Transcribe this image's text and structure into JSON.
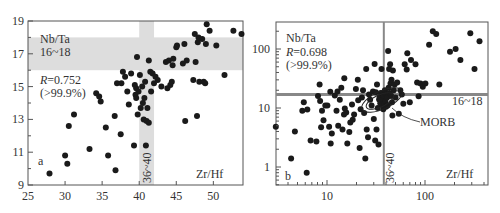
{
  "chart_data": [
    {
      "id": "a",
      "type": "scatter",
      "panel_label": "a",
      "xlabel": "Zr/Hf",
      "ylabel": "Nb/Ta",
      "xlim": [
        25,
        54
      ],
      "ylim": [
        9,
        19
      ],
      "x_scale": "linear",
      "y_scale": "linear",
      "x_ticks": [
        25,
        30,
        35,
        40,
        45,
        50
      ],
      "y_ticks": [
        9,
        11,
        13,
        15,
        17,
        19
      ],
      "grid": false,
      "annotations": {
        "y_band_label_1": "Nb/Ta",
        "y_band_label_2": "16~18",
        "r_label": "R=0.752",
        "r_value": "0.752",
        "significance": "(>99.9%)",
        "x_band_label": "36~40"
      },
      "bands": {
        "horizontal": {
          "from": 16,
          "to": 18,
          "color": "#dddddd"
        },
        "vertical": {
          "from": 40,
          "to": 42,
          "color": "#dddddd"
        }
      },
      "points": [
        [
          27.9,
          9.7
        ],
        [
          30.0,
          10.8
        ],
        [
          30.3,
          10.3
        ],
        [
          30.5,
          12.6
        ],
        [
          31.2,
          13.3
        ],
        [
          33.3,
          11.2
        ],
        [
          34.2,
          14.6
        ],
        [
          34.6,
          14.4
        ],
        [
          34.8,
          14.1
        ],
        [
          35.5,
          12.5
        ],
        [
          35.8,
          10.8
        ],
        [
          36.7,
          13.2
        ],
        [
          36.8,
          9.9
        ],
        [
          37.0,
          15.2
        ],
        [
          37.5,
          12.1
        ],
        [
          37.6,
          15.2
        ],
        [
          37.8,
          15.9
        ],
        [
          38.1,
          15.6
        ],
        [
          38.4,
          14.7
        ],
        [
          38.6,
          13.9
        ],
        [
          38.9,
          15.8
        ],
        [
          39.3,
          11.4
        ],
        [
          39.4,
          15.1
        ],
        [
          39.5,
          14.5
        ],
        [
          39.6,
          14.9
        ],
        [
          39.6,
          14.3
        ],
        [
          39.7,
          16.8
        ],
        [
          39.8,
          13.3
        ],
        [
          39.9,
          14.7
        ],
        [
          40.1,
          15.7
        ],
        [
          40.2,
          13.7
        ],
        [
          40.4,
          15.0
        ],
        [
          40.5,
          14.0
        ],
        [
          40.6,
          13.0
        ],
        [
          40.7,
          14.3
        ],
        [
          40.8,
          15.3
        ],
        [
          40.9,
          11.4
        ],
        [
          41.0,
          12.9
        ],
        [
          41.1,
          13.7
        ],
        [
          41.3,
          16.6
        ],
        [
          41.3,
          12.8
        ],
        [
          41.5,
          15.9
        ],
        [
          41.6,
          14.7
        ],
        [
          41.8,
          15.8
        ],
        [
          42.0,
          15.2
        ],
        [
          42.2,
          15.6
        ],
        [
          42.5,
          15.4
        ],
        [
          43.0,
          15.0
        ],
        [
          43.6,
          16.5
        ],
        [
          43.8,
          14.9
        ],
        [
          44.0,
          16.6
        ],
        [
          44.2,
          15.1
        ],
        [
          44.4,
          15.3
        ],
        [
          44.5,
          16.3
        ],
        [
          44.6,
          16.7
        ],
        [
          45.0,
          17.4
        ],
        [
          45.1,
          17.5
        ],
        [
          45.9,
          16.4
        ],
        [
          46.1,
          17.6
        ],
        [
          46.2,
          12.9
        ],
        [
          46.4,
          16.6
        ],
        [
          47.3,
          15.4
        ],
        [
          47.5,
          18.2
        ],
        [
          47.6,
          16.5
        ],
        [
          47.8,
          13.2
        ],
        [
          47.9,
          17.7
        ],
        [
          48.0,
          18.0
        ],
        [
          48.1,
          15.3
        ],
        [
          48.5,
          17.9
        ],
        [
          48.7,
          15.3
        ],
        [
          48.9,
          15.2
        ],
        [
          49.0,
          17.6
        ],
        [
          49.1,
          18.8
        ],
        [
          49.5,
          18.4
        ],
        [
          50.4,
          17.5
        ],
        [
          51.5,
          15.7
        ],
        [
          52.7,
          18.4
        ],
        [
          53.8,
          18.2
        ]
      ]
    },
    {
      "id": "b",
      "type": "scatter",
      "panel_label": "b",
      "xlabel": "Zr/Hf",
      "ylabel": "Nb/Ta",
      "xlim": [
        3,
        450
      ],
      "ylim": [
        0.4,
        300
      ],
      "x_scale": "log",
      "y_scale": "log",
      "x_ticks": [
        10,
        100
      ],
      "y_ticks": [
        1,
        10,
        100
      ],
      "grid": false,
      "annotations": {
        "y_label": "Nb/Ta",
        "r_label": "R=0.698",
        "r_value": "0.698",
        "significance": "(>99.9%)",
        "x_line_label": "36~40",
        "y_line_label": "16~18",
        "field_label": "MORB"
      },
      "reference_lines": {
        "horizontal": 17,
        "vertical": 38,
        "color": "#888888"
      },
      "points": [
        [
          3.0,
          4.8
        ],
        [
          4.3,
          1.4
        ],
        [
          4.7,
          4.0
        ],
        [
          5.6,
          9.0
        ],
        [
          5.8,
          12.5
        ],
        [
          6.2,
          0.8
        ],
        [
          6.3,
          9.4
        ],
        [
          6.8,
          2.8
        ],
        [
          7.8,
          2.7
        ],
        [
          8.1,
          16
        ],
        [
          8.4,
          25
        ],
        [
          8.5,
          13.2
        ],
        [
          8.7,
          4.7
        ],
        [
          8.9,
          9
        ],
        [
          9.2,
          6.2
        ],
        [
          9.6,
          11
        ],
        [
          10.1,
          11
        ],
        [
          10.5,
          4.8
        ],
        [
          10.8,
          18.8
        ],
        [
          10.9,
          2.5
        ],
        [
          11.2,
          3.7
        ],
        [
          12.0,
          16.2
        ],
        [
          12.5,
          9
        ],
        [
          12.8,
          19
        ],
        [
          13.0,
          5
        ],
        [
          13.5,
          13.8
        ],
        [
          14.0,
          22
        ],
        [
          14.4,
          4.3
        ],
        [
          14.9,
          7.8
        ],
        [
          15.0,
          32
        ],
        [
          15.2,
          9.8
        ],
        [
          15.7,
          8.4
        ],
        [
          16.1,
          2.5
        ],
        [
          16.9,
          3.9
        ],
        [
          17.3,
          5.7
        ],
        [
          18.0,
          11.5
        ],
        [
          18.3,
          6.3
        ],
        [
          18.9,
          7.8
        ],
        [
          19.7,
          21
        ],
        [
          20.6,
          30
        ],
        [
          20.8,
          13.5
        ],
        [
          21.5,
          2.1
        ],
        [
          22.0,
          9.5
        ],
        [
          22.7,
          15
        ],
        [
          23.3,
          20
        ],
        [
          23.9,
          8.2
        ],
        [
          24.6,
          1.4
        ],
        [
          25.1,
          46
        ],
        [
          25.4,
          4.3
        ],
        [
          26.2,
          3.2
        ],
        [
          26.8,
          17
        ],
        [
          27.5,
          13.8
        ],
        [
          28.5,
          11
        ],
        [
          29.5,
          19
        ],
        [
          30.0,
          6.5
        ],
        [
          30.6,
          56
        ],
        [
          31.0,
          2.8
        ],
        [
          31.5,
          18.5
        ],
        [
          32.0,
          4.3
        ],
        [
          32.4,
          25
        ],
        [
          33.0,
          10
        ],
        [
          33.5,
          2.4
        ],
        [
          34.0,
          14
        ],
        [
          34.5,
          15
        ],
        [
          35.0,
          12
        ],
        [
          35.5,
          18
        ],
        [
          36.0,
          46
        ],
        [
          36.5,
          11.5
        ],
        [
          37.0,
          14
        ],
        [
          37.5,
          9.5
        ],
        [
          38.0,
          16
        ],
        [
          38.5,
          12
        ],
        [
          39.0,
          20
        ],
        [
          39.5,
          13
        ],
        [
          40.0,
          10.5
        ],
        [
          40.5,
          17
        ],
        [
          41.0,
          15
        ],
        [
          41.5,
          11
        ],
        [
          42.0,
          93
        ],
        [
          42.5,
          22
        ],
        [
          43.0,
          46
        ],
        [
          43.5,
          18
        ],
        [
          44.0,
          55
        ],
        [
          44.5,
          26
        ],
        [
          45.0,
          16
        ],
        [
          45.5,
          30
        ],
        [
          46.0,
          12.5
        ],
        [
          46.5,
          7.5
        ],
        [
          47.0,
          43
        ],
        [
          48.0,
          20
        ],
        [
          49.0,
          25
        ],
        [
          50.0,
          15
        ],
        [
          52.0,
          27
        ],
        [
          54.0,
          8
        ],
        [
          56.0,
          20
        ],
        [
          58.0,
          17
        ],
        [
          60.0,
          11.8
        ],
        [
          62.0,
          55
        ],
        [
          65.0,
          45
        ],
        [
          66.0,
          85
        ],
        [
          70.0,
          12.5
        ],
        [
          72.0,
          65
        ],
        [
          80.0,
          55
        ],
        [
          83.0,
          27
        ],
        [
          86.0,
          15.8
        ],
        [
          90.0,
          26
        ],
        [
          95.0,
          23
        ],
        [
          101.0,
          26
        ],
        [
          110.0,
          118
        ],
        [
          120.0,
          200
        ],
        [
          130.0,
          180
        ],
        [
          140.0,
          25
        ],
        [
          180.0,
          90
        ],
        [
          205.0,
          100
        ],
        [
          230.0,
          65
        ],
        [
          290.0,
          185
        ],
        [
          320.0,
          46
        ],
        [
          360.0,
          135
        ]
      ]
    }
  ]
}
